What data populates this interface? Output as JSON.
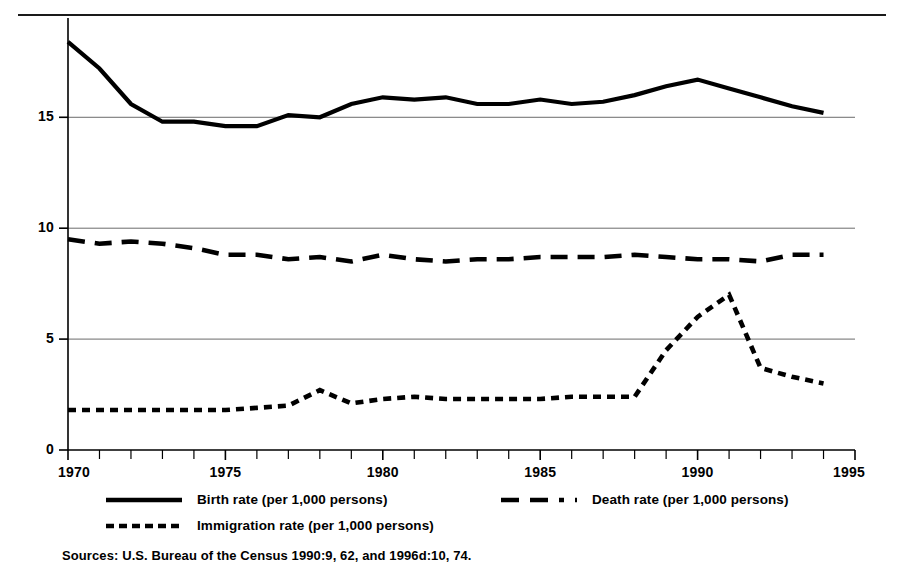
{
  "chart_data": {
    "type": "line",
    "title": "",
    "subtitle": "",
    "xlabel": "",
    "ylabel": "",
    "xlim": [
      1970,
      1995
    ],
    "ylim": [
      0,
      18.8
    ],
    "grid": true,
    "grid_axis": "y",
    "legend_position": "bottom",
    "yticks": [
      "0",
      "5",
      "10",
      "15"
    ],
    "ytick_values": [
      0,
      5,
      10,
      15
    ],
    "xticks": [
      "1970",
      "1975",
      "1980",
      "1985",
      "1990",
      "1995"
    ],
    "xtick_values": [
      1970,
      1975,
      1980,
      1985,
      1990,
      1995
    ],
    "x": [
      1970,
      1971,
      1972,
      1973,
      1974,
      1975,
      1976,
      1977,
      1978,
      1979,
      1980,
      1981,
      1982,
      1983,
      1984,
      1985,
      1986,
      1987,
      1988,
      1989,
      1990,
      1991,
      1992,
      1993,
      1994
    ],
    "series": [
      {
        "name": "Birth rate  (per 1,000 persons)",
        "style": "solid",
        "color": "#000000",
        "values": [
          18.4,
          17.2,
          15.6,
          14.8,
          14.8,
          14.6,
          14.6,
          15.1,
          15.0,
          15.6,
          15.9,
          15.8,
          15.9,
          15.6,
          15.6,
          15.8,
          15.6,
          15.7,
          16.0,
          16.4,
          16.7,
          16.3,
          15.9,
          15.5,
          15.2
        ],
        "legend_label": "Birth rate  (per 1,000 persons)"
      },
      {
        "name": "Death rate (per 1,000 persons)",
        "style": "dashed",
        "color": "#000000",
        "values": [
          9.5,
          9.3,
          9.4,
          9.3,
          9.1,
          8.8,
          8.8,
          8.6,
          8.7,
          8.5,
          8.8,
          8.6,
          8.5,
          8.6,
          8.6,
          8.7,
          8.7,
          8.7,
          8.8,
          8.7,
          8.6,
          8.6,
          8.5,
          8.8,
          8.8
        ],
        "legend_label": "Death rate (per 1,000 persons)"
      },
      {
        "name": "Immigration rate (per 1,000 persons)",
        "style": "dotted",
        "color": "#000000",
        "values": [
          1.8,
          1.8,
          1.8,
          1.8,
          1.8,
          1.8,
          1.9,
          2.0,
          2.7,
          2.1,
          2.3,
          2.4,
          2.3,
          2.3,
          2.3,
          2.3,
          2.4,
          2.4,
          2.4,
          4.5,
          6.0,
          7.0,
          3.7,
          3.3,
          3.0
        ],
        "legend_label": "Immigration rate (per 1,000 persons)"
      }
    ]
  },
  "legend": {
    "birth": "Birth rate  (per 1,000 persons)",
    "death": "Death rate (per 1,000 persons)",
    "immigration": "Immigration rate (per 1,000 persons)"
  },
  "sources": {
    "text": "Sources: U.S. Bureau of the Census 1990:9, 62, and 1996d:10, 74."
  }
}
